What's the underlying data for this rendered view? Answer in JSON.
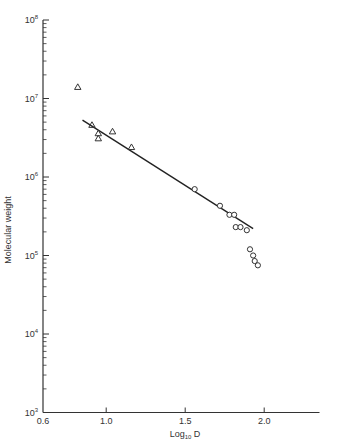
{
  "chart_data": {
    "type": "scatter",
    "title": "",
    "xlabel": "Log10 D",
    "xlabel_main": "Log",
    "xlabel_sub": "10",
    "xlabel_tail": " D",
    "ylabel": "Molecular weight",
    "xlim": [
      0.6,
      2.35
    ],
    "ylim": [
      1000,
      100000000
    ],
    "yscale": "log",
    "grid": false,
    "legend": null,
    "x_ticks": [
      {
        "value": 0.6,
        "label": "0.6"
      },
      {
        "value": 1.0,
        "label": "1.0"
      },
      {
        "value": 1.5,
        "label": "1.5"
      },
      {
        "value": 2.0,
        "label": "2.0"
      }
    ],
    "y_ticks": [
      {
        "exp": 3,
        "base": "10",
        "sup": "3"
      },
      {
        "exp": 4,
        "base": "10",
        "sup": "4"
      },
      {
        "exp": 5,
        "base": "10",
        "sup": "5"
      },
      {
        "exp": 6,
        "base": "10",
        "sup": "6"
      },
      {
        "exp": 7,
        "base": "10",
        "sup": "7"
      },
      {
        "exp": 8,
        "base": "10",
        "sup": "8"
      }
    ],
    "series": [
      {
        "name": "triangles",
        "marker": "triangle-open",
        "points": [
          {
            "x": 0.82,
            "y": 14000000
          },
          {
            "x": 0.91,
            "y": 4600000
          },
          {
            "x": 0.95,
            "y": 3600000
          },
          {
            "x": 0.95,
            "y": 3100000
          },
          {
            "x": 1.04,
            "y": 3800000
          },
          {
            "x": 1.16,
            "y": 2400000
          }
        ]
      },
      {
        "name": "circles",
        "marker": "circle-open",
        "points": [
          {
            "x": 1.56,
            "y": 700000
          },
          {
            "x": 1.72,
            "y": 430000
          },
          {
            "x": 1.78,
            "y": 330000
          },
          {
            "x": 1.81,
            "y": 330000
          },
          {
            "x": 1.82,
            "y": 230000
          },
          {
            "x": 1.85,
            "y": 230000
          },
          {
            "x": 1.89,
            "y": 210000
          },
          {
            "x": 1.91,
            "y": 120000
          },
          {
            "x": 1.93,
            "y": 100000
          },
          {
            "x": 1.94,
            "y": 85000
          },
          {
            "x": 1.96,
            "y": 75000
          }
        ]
      }
    ],
    "fit_line": {
      "x": [
        0.85,
        1.93
      ],
      "y": [
        5300000,
        220000
      ]
    }
  }
}
